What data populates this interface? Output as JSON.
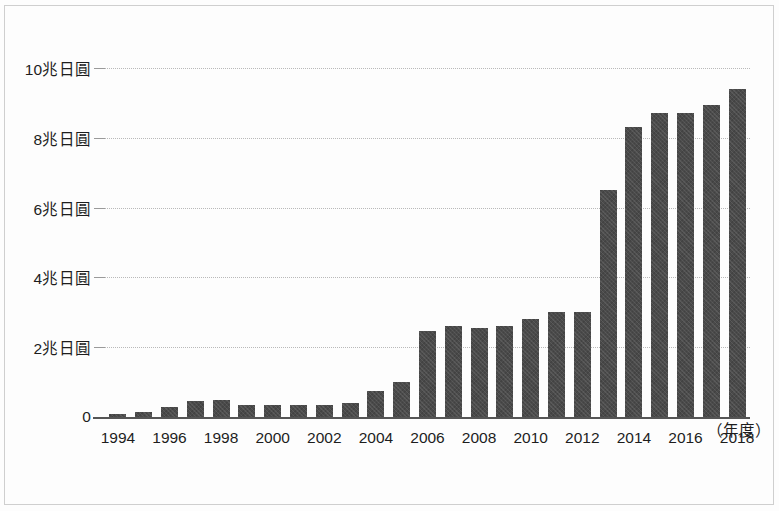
{
  "chart_data": {
    "type": "bar",
    "title": "",
    "xlabel": "（年度）",
    "ylabel": "",
    "ylim": [
      0,
      10.8
    ],
    "grid": true,
    "legend": null,
    "y_ticks": [
      {
        "value": 0,
        "label": "0"
      },
      {
        "value": 2,
        "label": "2兆日圓"
      },
      {
        "value": 4,
        "label": "4兆日圓"
      },
      {
        "value": 6,
        "label": "6兆日圓"
      },
      {
        "value": 8,
        "label": "8兆日圓"
      },
      {
        "value": 10,
        "label": "10兆日圓"
      }
    ],
    "categories": [
      "1994",
      "1995",
      "1996",
      "1997",
      "1998",
      "1999",
      "2000",
      "2001",
      "2002",
      "2003",
      "2004",
      "2005",
      "2006",
      "2007",
      "2008",
      "2009",
      "2010",
      "2011",
      "2012",
      "2013",
      "2014",
      "2015",
      "2016",
      "2017",
      "2018"
    ],
    "x_tick_labels": [
      "1994",
      "1996",
      "1998",
      "2000",
      "2002",
      "2004",
      "2006",
      "2008",
      "2010",
      "2012",
      "2014",
      "2016",
      "2018"
    ],
    "values": [
      0.08,
      0.15,
      0.3,
      0.45,
      0.5,
      0.35,
      0.35,
      0.35,
      0.35,
      0.4,
      0.75,
      1.0,
      2.45,
      2.62,
      2.55,
      2.6,
      2.8,
      3.0,
      3.0,
      6.5,
      8.3,
      8.7,
      8.7,
      8.95,
      9.4
    ],
    "bar_color": "#4a4a4a",
    "grid_color": "#b9b9b9",
    "axis_color": "#555555",
    "background_color": "#fdfdfd"
  }
}
